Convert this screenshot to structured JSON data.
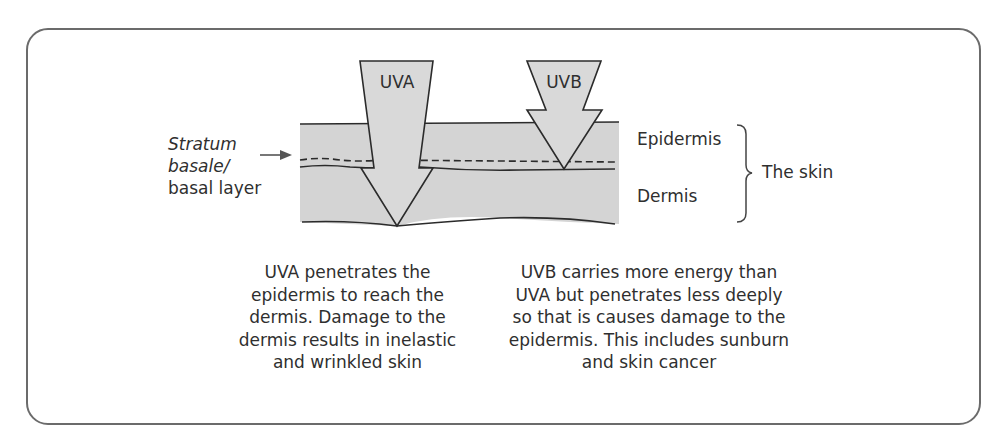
{
  "diagram": {
    "arrows": [
      {
        "id": "uva",
        "label": "UVA",
        "reaches": "Dermis"
      },
      {
        "id": "uvb",
        "label": "UVB",
        "reaches": "Stratum basale (bottom of epidermis)"
      }
    ],
    "layers": {
      "epidermis": "Epidermis",
      "dermis": "Dermis",
      "group": "The skin"
    },
    "basal_label": {
      "line1": "Stratum",
      "line2": "basale/",
      "line3": "basal layer"
    },
    "captions": {
      "uva": [
        "UVA penetrates the",
        "epidermis to reach the",
        "dermis. Damage to the",
        "dermis results in inelastic",
        "and wrinkled skin"
      ],
      "uvb": [
        "UVB carries more energy than",
        "UVA but penetrates less deeply",
        "so that is causes damage to the",
        "epidermis. This includes sunburn",
        "and skin cancer"
      ]
    },
    "colors": {
      "skin_fill": "#d4d4d4",
      "arrow_fill": "#d9d9d9",
      "stroke": "#2b2b2b",
      "frame": "#6b6b6b",
      "text": "#2f2f2f"
    }
  }
}
